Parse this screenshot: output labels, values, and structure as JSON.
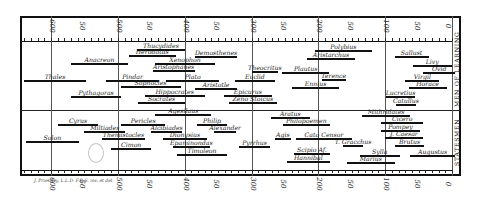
{
  "chart_data": {
    "type": "timeline",
    "title": "",
    "x_axis": {
      "label": "Years before Christ",
      "range": [
        650,
        -5
      ],
      "ticks": [
        {
          "value": 600,
          "label": "600"
        },
        {
          "value": 550,
          "label": "50"
        },
        {
          "value": 500,
          "label": "500"
        },
        {
          "value": 450,
          "label": "50"
        },
        {
          "value": 400,
          "label": "400"
        },
        {
          "value": 350,
          "label": "50"
        },
        {
          "value": 300,
          "label": "300"
        },
        {
          "value": 250,
          "label": "50"
        },
        {
          "value": 200,
          "label": "200"
        },
        {
          "value": 150,
          "label": "50"
        },
        {
          "value": 100,
          "label": "100"
        },
        {
          "value": 50,
          "label": "50"
        },
        {
          "value": 0,
          "label": "0"
        }
      ],
      "grid": true
    },
    "sections": [
      {
        "name": "Men of Learning",
        "entries": [
          {
            "name": "Thucydides",
            "start": 471,
            "end": 400
          },
          {
            "name": "Herodotus",
            "start": 484,
            "end": 413
          },
          {
            "name": "Demosthenes",
            "start": 384,
            "end": 322
          },
          {
            "name": "Anacreon",
            "start": 570,
            "end": 485
          },
          {
            "name": "Xenophon",
            "start": 444,
            "end": 355
          },
          {
            "name": "Aristophanes",
            "start": 448,
            "end": 385
          },
          {
            "name": "Polybius",
            "start": 205,
            "end": 120
          },
          {
            "name": "Aristarchus",
            "start": 217,
            "end": 145
          },
          {
            "name": "Sallust",
            "start": 86,
            "end": 35
          },
          {
            "name": "Livy",
            "start": 59,
            "end": 0
          },
          {
            "name": "Ovid",
            "start": 43,
            "end": -5
          },
          {
            "name": "Theocritus",
            "start": 300,
            "end": 260
          },
          {
            "name": "Plautus",
            "start": 254,
            "end": 184
          },
          {
            "name": "Terence",
            "start": 195,
            "end": 159
          },
          {
            "name": "Virgil",
            "start": 70,
            "end": 19
          },
          {
            "name": "Horace",
            "start": 65,
            "end": 8
          },
          {
            "name": "Thales",
            "start": 640,
            "end": 548
          },
          {
            "name": "Pindar",
            "start": 518,
            "end": 438
          },
          {
            "name": "Sophocles",
            "start": 496,
            "end": 406
          },
          {
            "name": "Plato",
            "start": 428,
            "end": 348
          },
          {
            "name": "Euclid",
            "start": 325,
            "end": 265
          },
          {
            "name": "Ennius",
            "start": 239,
            "end": 169
          },
          {
            "name": "Pythagoras",
            "start": 570,
            "end": 495
          },
          {
            "name": "Aristotle",
            "start": 384,
            "end": 322
          },
          {
            "name": "Hippocrates",
            "start": 460,
            "end": 370
          },
          {
            "name": "Epicurus",
            "start": 341,
            "end": 270
          },
          {
            "name": "Lucretius",
            "start": 99,
            "end": 55
          },
          {
            "name": "Socrates",
            "start": 470,
            "end": 399
          },
          {
            "name": "Zeno Stoicus",
            "start": 334,
            "end": 262
          },
          {
            "name": "Catullus",
            "start": 84,
            "end": 54
          }
        ]
      },
      {
        "name": "Statesmen",
        "entries": [
          {
            "name": "Agesilaus",
            "start": 444,
            "end": 360
          },
          {
            "name": "Aratus",
            "start": 271,
            "end": 213
          },
          {
            "name": "Mithridates",
            "start": 134,
            "end": 63
          },
          {
            "name": "Cyrus",
            "start": 590,
            "end": 529
          },
          {
            "name": "Pericles",
            "start": 495,
            "end": 429
          },
          {
            "name": "Philip",
            "start": 382,
            "end": 336
          },
          {
            "name": "Philopoemen",
            "start": 253,
            "end": 183
          },
          {
            "name": "Cicero",
            "start": 106,
            "end": 43
          },
          {
            "name": "Miltiades",
            "start": 550,
            "end": 489
          },
          {
            "name": "Alcibiades",
            "start": 450,
            "end": 404
          },
          {
            "name": "Alexander",
            "start": 356,
            "end": 323
          },
          {
            "name": "Pompey",
            "start": 106,
            "end": 48
          },
          {
            "name": "Solon",
            "start": 638,
            "end": 558
          },
          {
            "name": "Themistocles",
            "start": 524,
            "end": 459
          },
          {
            "name": "Dionysius",
            "start": 432,
            "end": 367
          },
          {
            "name": "Agis",
            "start": 265,
            "end": 241
          },
          {
            "name": "Cato Censor",
            "start": 234,
            "end": 149
          },
          {
            "name": "J. Caesar",
            "start": 100,
            "end": 44
          },
          {
            "name": "T. Gracchus",
            "start": 163,
            "end": 133
          },
          {
            "name": "Brutus",
            "start": 85,
            "end": 42
          },
          {
            "name": "Cimon",
            "start": 510,
            "end": 450
          },
          {
            "name": "Epaminondas",
            "start": 418,
            "end": 362
          },
          {
            "name": "Pyrrhus",
            "start": 319,
            "end": 272
          },
          {
            "name": "Scipio Af.",
            "start": 236,
            "end": 183
          },
          {
            "name": "Sylla",
            "start": 138,
            "end": 78
          },
          {
            "name": "Augustus",
            "start": 63,
            "end": -5
          },
          {
            "name": "Timoleon",
            "start": 411,
            "end": 337
          },
          {
            "name": "Hannibal",
            "start": 247,
            "end": 183
          },
          {
            "name": "Marius",
            "start": 157,
            "end": 86
          }
        ]
      }
    ],
    "legend": [],
    "grid": true,
    "layout": {
      "side_labels_position": "right",
      "axis_ticks": "top-and-bottom"
    }
  },
  "side_labels": {
    "top": "Men of Learning",
    "bottom": "Statesmen"
  },
  "credit": "J. Priestley, L.L.D. F.R.S. inv. et del."
}
